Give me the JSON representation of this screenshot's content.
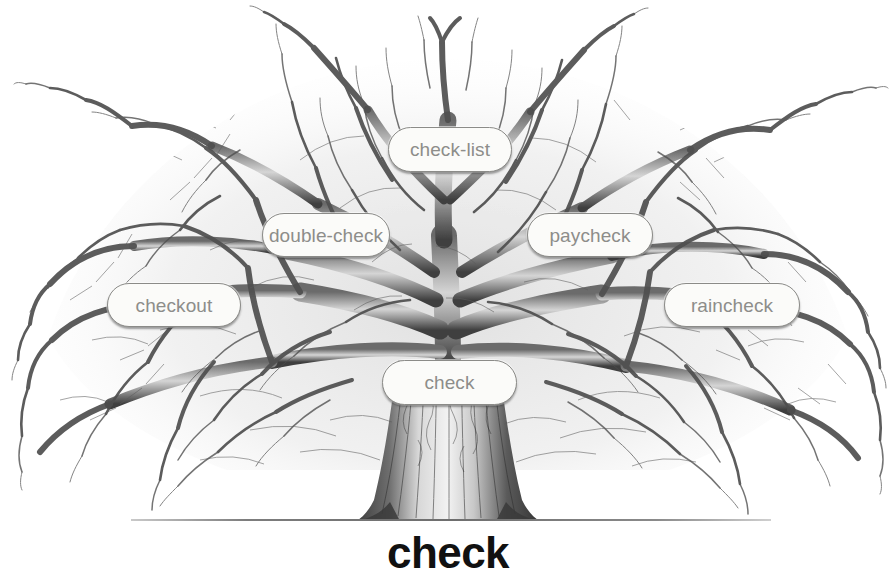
{
  "canvas": {
    "width": 896,
    "height": 579,
    "background": "#ffffff"
  },
  "illustration": {
    "name": "word-family-tree",
    "subject": "bare deciduous tree, pen-and-ink style, grey tones",
    "ink_color": "#555555",
    "trunk_base_color": "#4a4a4a"
  },
  "caption": {
    "text": "check",
    "color": "#111111"
  },
  "ground": {
    "label": "ground-line",
    "color": "#7d7d7d"
  },
  "pills": {
    "fill": "#fbfbf9",
    "border": "#8b8b88",
    "text_color": "#8d8d8a",
    "items": [
      {
        "id": "check-list",
        "label": "check-list"
      },
      {
        "id": "double-check",
        "label": "double-check"
      },
      {
        "id": "paycheck",
        "label": "paycheck"
      },
      {
        "id": "checkout",
        "label": "checkout"
      },
      {
        "id": "raincheck",
        "label": "raincheck"
      },
      {
        "id": "check",
        "label": "check"
      }
    ]
  }
}
